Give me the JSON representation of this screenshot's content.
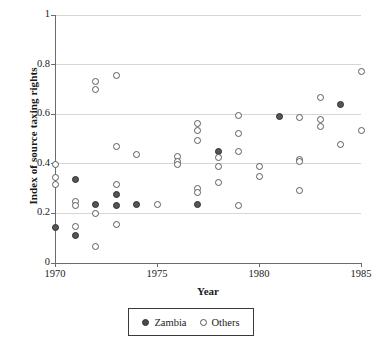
{
  "chart_data": {
    "type": "scatter",
    "title": "",
    "xlabel": "Year",
    "ylabel": "Index of source taxing rights",
    "xlim": [
      1970,
      1985
    ],
    "ylim": [
      0,
      1
    ],
    "xticks": [
      1970,
      1975,
      1980,
      1985
    ],
    "yticks": [
      0,
      0.2,
      0.4,
      0.6,
      0.8,
      1
    ],
    "xtick_labels": [
      "1970",
      "1975",
      "1980",
      "1985"
    ],
    "ytick_labels": [
      "0",
      "0.2",
      "0.4",
      "0.6",
      "0.8",
      "1"
    ],
    "grid": "horizontal",
    "legend_position": "below-plot",
    "series": [
      {
        "name": "Zambia",
        "marker": "filled-circle",
        "color": "#55565a",
        "points": [
          {
            "x": 1970,
            "y": 0.145
          },
          {
            "x": 1971,
            "y": 0.335
          },
          {
            "x": 1971,
            "y": 0.112
          },
          {
            "x": 1972,
            "y": 0.235
          },
          {
            "x": 1973,
            "y": 0.278
          },
          {
            "x": 1973,
            "y": 0.23
          },
          {
            "x": 1974,
            "y": 0.235
          },
          {
            "x": 1977,
            "y": 0.236
          },
          {
            "x": 1978,
            "y": 0.45
          },
          {
            "x": 1981,
            "y": 0.589
          },
          {
            "x": 1984,
            "y": 0.641
          }
        ]
      },
      {
        "name": "Others",
        "marker": "open-circle",
        "color": "#ffffff",
        "points": [
          {
            "x": 1970,
            "y": 0.397
          },
          {
            "x": 1970,
            "y": 0.345
          },
          {
            "x": 1970,
            "y": 0.318
          },
          {
            "x": 1971,
            "y": 0.249
          },
          {
            "x": 1971,
            "y": 0.233
          },
          {
            "x": 1971,
            "y": 0.146
          },
          {
            "x": 1972,
            "y": 0.731
          },
          {
            "x": 1972,
            "y": 0.699
          },
          {
            "x": 1972,
            "y": 0.2
          },
          {
            "x": 1972,
            "y": 0.068
          },
          {
            "x": 1973,
            "y": 0.755
          },
          {
            "x": 1973,
            "y": 0.47
          },
          {
            "x": 1973,
            "y": 0.315
          },
          {
            "x": 1973,
            "y": 0.157
          },
          {
            "x": 1974,
            "y": 0.438
          },
          {
            "x": 1975,
            "y": 0.234
          },
          {
            "x": 1976,
            "y": 0.428
          },
          {
            "x": 1976,
            "y": 0.409
          },
          {
            "x": 1976,
            "y": 0.398
          },
          {
            "x": 1977,
            "y": 0.561
          },
          {
            "x": 1977,
            "y": 0.536
          },
          {
            "x": 1977,
            "y": 0.494
          },
          {
            "x": 1977,
            "y": 0.299
          },
          {
            "x": 1977,
            "y": 0.284
          },
          {
            "x": 1978,
            "y": 0.424
          },
          {
            "x": 1978,
            "y": 0.39
          },
          {
            "x": 1978,
            "y": 0.326
          },
          {
            "x": 1979,
            "y": 0.594
          },
          {
            "x": 1979,
            "y": 0.521
          },
          {
            "x": 1979,
            "y": 0.45
          },
          {
            "x": 1979,
            "y": 0.23
          },
          {
            "x": 1980,
            "y": 0.389
          },
          {
            "x": 1980,
            "y": 0.35
          },
          {
            "x": 1982,
            "y": 0.586
          },
          {
            "x": 1982,
            "y": 0.419
          },
          {
            "x": 1982,
            "y": 0.408
          },
          {
            "x": 1982,
            "y": 0.293
          },
          {
            "x": 1983,
            "y": 0.666
          },
          {
            "x": 1983,
            "y": 0.577
          },
          {
            "x": 1983,
            "y": 0.551
          },
          {
            "x": 1984,
            "y": 0.478
          },
          {
            "x": 1985,
            "y": 0.771
          },
          {
            "x": 1985,
            "y": 0.534
          }
        ]
      }
    ]
  },
  "legend": {
    "entries": [
      {
        "label": "Zambia"
      },
      {
        "label": "Others"
      }
    ]
  },
  "axes": {
    "x_title": "Year",
    "y_title": "Index of source taxing rights"
  }
}
